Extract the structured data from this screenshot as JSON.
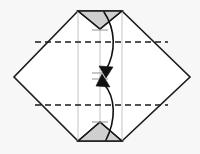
{
  "figure": {
    "caption": "",
    "canvas": {
      "width": 200,
      "height": 154,
      "background": "#f7f7f7"
    },
    "colors": {
      "paper_fill": "#ffffff",
      "shaded_flap_fill": "#cfcfcf",
      "outline": "#1a1a1a",
      "crease_dashed": "#1a1a1a",
      "guide_line": "#c8c8c8",
      "arrow": "#111111"
    },
    "shapes": {
      "paper_outline_name": "hexagonal-paper-outline",
      "paper_outline_points": "78,11 122,11 190,77 122,141 78,141 14,77",
      "top_shaded_flap_name": "top-shaded-flap",
      "top_shaded_flap_points": "78,11 122,11 122,28 100,28 100,12",
      "top_shaded_triangle_points": "78,11 122,11 100,29",
      "bottom_shaded_triangle_name": "bottom-shaded-triangle",
      "bottom_shaded_triangle_points": "100,122 122,141 78,141"
    },
    "creases": {
      "dashed_fold_upper_label": "upper-valley-fold",
      "dashed_fold_upper_path": "M 35,42 L 168,42",
      "dashed_fold_lower_label": "lower-valley-fold",
      "dashed_fold_lower_path": "M 35,105 L 168,105",
      "top_left_diagonal_path": "M 78,11 L 100,29",
      "top_right_diagonal_path": "M 122,11 L 100,29",
      "bottom_left_diagonal_path": "M 78,141 L 100,122",
      "bottom_right_diagonal_path": "M 122,141 L 100,122"
    },
    "guides": {
      "vertical_left_path": "M 78,11 L 78,141",
      "vertical_center_path": "M 100,12 L 100,141",
      "vertical_right_path": "M 122,11 L 122,141",
      "tick_top_path": "M 92,30 L 108,30",
      "tick_center_upper_path": "M 92,73 L 108,73",
      "tick_center_lower_path": "M 92,79 L 108,79",
      "tick_bottom_path": "M 92,122 L 108,122"
    },
    "arrows": [
      {
        "name": "fold-down-arrow",
        "direction": "down",
        "curve_path": "M 104,12 C 116,30 116,52 106,70",
        "head_points": "106,78 99,66 113,67"
      },
      {
        "name": "fold-up-arrow",
        "direction": "up",
        "curve_path": "M 106,140 C 116,120 116,98 104,84",
        "head_points": "102,74 110,87 96,86"
      }
    ],
    "labels": {
      "step_number": "",
      "annotation": ""
    }
  }
}
